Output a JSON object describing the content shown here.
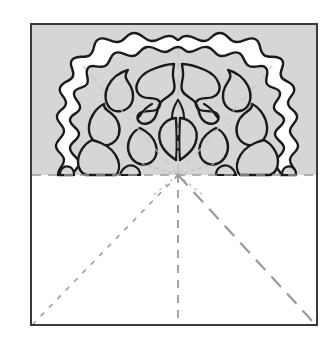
{
  "figure": {
    "canvas": {
      "width": 334,
      "height": 352,
      "background": "#ffffff"
    },
    "square": {
      "name": "paper-sheet",
      "x": 31,
      "y": 24,
      "width": 286,
      "height": 301,
      "stroke": "#3a3a3a",
      "stroke_width": 2,
      "fill": "#ffffff"
    },
    "shaded_region": {
      "name": "upper-half-shading",
      "label": "folded layer",
      "x": 32,
      "y": 25,
      "width": 284,
      "height": 150,
      "fill": "#d6d6d6"
    },
    "colors": {
      "paper_white": "#ffffff",
      "shade_gray": "#d6d6d6",
      "cut_outline": "#1a1a1a",
      "border_gray": "#3a3a3a",
      "fold_line": "#9a9a9a",
      "fold_line_faint": "#c2c2c2"
    },
    "center_point": {
      "name": "fold-convergence-point",
      "x": 178,
      "y": 175
    },
    "fold_lines": [
      {
        "name": "horizontal-mid-fold",
        "style": "dashed",
        "x1": 32,
        "y1": 175,
        "x2": 316,
        "y2": 175,
        "dash": "9,7",
        "width": 1.6,
        "color": "#9a9a9a"
      },
      {
        "name": "vertical-center-fold",
        "style": "dashed",
        "x1": 178,
        "y1": 175,
        "x2": 178,
        "y2": 325,
        "dash": "8,7",
        "width": 1.8,
        "color": "#9a9a9a"
      },
      {
        "name": "diagonal-fold-bottom-left",
        "style": "dotted",
        "x1": 178,
        "y1": 175,
        "x2": 33,
        "y2": 324,
        "dash": "5,7",
        "width": 1.6,
        "color": "#9e9e9e"
      },
      {
        "name": "diagonal-fold-bottom-right",
        "style": "dashed-long",
        "x1": 178,
        "y1": 175,
        "x2": 315,
        "y2": 324,
        "dash": "14,9",
        "width": 2.2,
        "color": "#9a9a9a"
      },
      {
        "name": "vertical-center-fold-upper",
        "style": "faint",
        "x1": 178,
        "y1": 50,
        "x2": 178,
        "y2": 175,
        "dash": "7,6",
        "width": 1.4,
        "color": "#c2c2c2"
      },
      {
        "name": "diagonal-fold-upper-left",
        "style": "faint",
        "x1": 178,
        "y1": 175,
        "x2": 83,
        "y2": 66,
        "dash": "7,7",
        "width": 1.4,
        "color": "#c6c6c6"
      },
      {
        "name": "diagonal-fold-upper-right",
        "style": "faint",
        "x1": 178,
        "y1": 175,
        "x2": 272,
        "y2": 66,
        "dash": "7,7",
        "width": 1.4,
        "color": "#c6c6c6"
      },
      {
        "name": "starburst-ray-left",
        "style": "faint",
        "x1": 178,
        "y1": 175,
        "x2": 140,
        "y2": 163,
        "dash": "3,4",
        "width": 1.2,
        "color": "#b8b8b8"
      },
      {
        "name": "starburst-ray-right",
        "style": "faint",
        "x1": 178,
        "y1": 175,
        "x2": 216,
        "y2": 163,
        "dash": "3,4",
        "width": 1.2,
        "color": "#b8b8b8"
      },
      {
        "name": "starburst-ray-down-left",
        "style": "faint",
        "x1": 178,
        "y1": 175,
        "x2": 152,
        "y2": 196,
        "dash": "3,4",
        "width": 1.2,
        "color": "#b8b8b8"
      },
      {
        "name": "starburst-ray-down-right",
        "style": "faint",
        "x1": 178,
        "y1": 175,
        "x2": 204,
        "y2": 196,
        "dash": "3,4",
        "width": 1.2,
        "color": "#b8b8b8"
      }
    ],
    "motif": {
      "name": "floral-papercut-motif",
      "symmetry": "mirror about vertical center line x=178",
      "outer_scallop_top_y": 48,
      "outer_extent_left_x": 58,
      "outer_extent_right_x": 298,
      "base_y": 175,
      "stroke": "#1a1a1a",
      "stroke_width": 2.4,
      "fill": "#ffffff"
    }
  }
}
